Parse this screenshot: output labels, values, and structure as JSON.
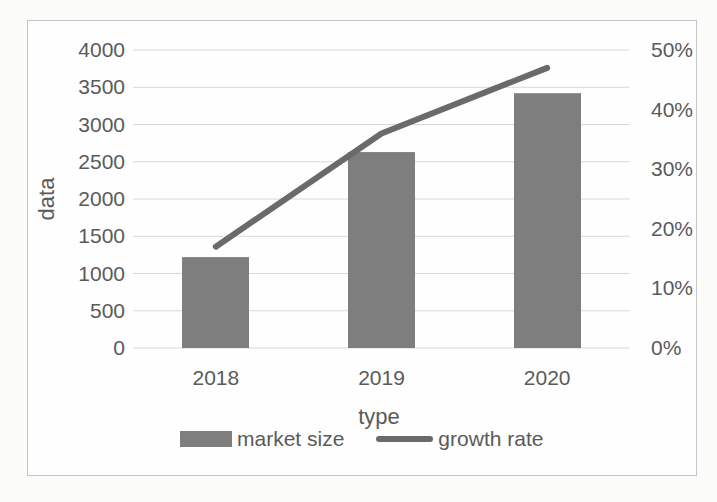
{
  "chart_data": {
    "type": "combo",
    "categories": [
      "2018",
      "2019",
      "2020"
    ],
    "series": [
      {
        "name": "market size",
        "chart": "bar",
        "axis": "left",
        "values": [
          1220,
          2630,
          3420
        ]
      },
      {
        "name": "growth rate",
        "chart": "line",
        "axis": "right",
        "values": [
          17,
          36,
          47
        ],
        "unit": "%"
      }
    ],
    "title": "",
    "xlabel": "type",
    "ylabel": "data",
    "y_left": {
      "min": 0,
      "max": 4000,
      "step": 500,
      "ticks": [
        "4000",
        "3500",
        "3000",
        "2500",
        "2000",
        "1500",
        "1000",
        "500",
        "0"
      ]
    },
    "y_right": {
      "min": 0,
      "max": 50,
      "step": 10,
      "ticks": [
        "50%",
        "40%",
        "30%",
        "20%",
        "10%",
        "0%"
      ]
    },
    "grid": true,
    "legend_position": "bottom",
    "legend": [
      {
        "label": "market size",
        "swatch": "bar"
      },
      {
        "label": "growth rate",
        "swatch": "line"
      }
    ]
  },
  "colors": {
    "bar": "#7e7e7e",
    "line": "#6a6a6a",
    "grid": "#d8d8d8",
    "text": "#5a5a5a",
    "frame_border": "#c6c6c6",
    "page_background": "#fbfbf9",
    "plot_background": "#fefefe"
  }
}
